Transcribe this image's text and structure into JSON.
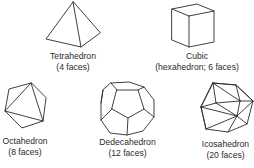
{
  "figure": {
    "shapes": [
      {
        "name": "Tetrahedron",
        "caption": "(4 faces)"
      },
      {
        "name": "Cubic",
        "caption": "(hexahedron; 6 faces)"
      },
      {
        "name": "Octahedron",
        "caption": "(8 faces)"
      },
      {
        "name": "Dedecahedron",
        "caption": "(12 faces)"
      },
      {
        "name": "Icosahedron",
        "caption": "(20 faces)"
      }
    ]
  }
}
